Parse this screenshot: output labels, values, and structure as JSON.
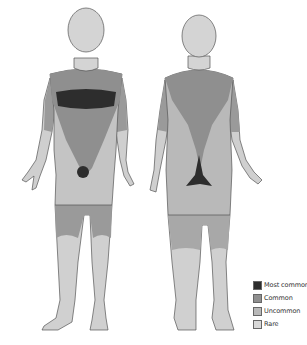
{
  "diagram": {
    "title": "",
    "views": [
      {
        "id": "front",
        "label": ""
      },
      {
        "id": "back",
        "label": ""
      }
    ]
  },
  "colors": {
    "most_common": "#2d2d2d",
    "common": "#8f8f8f",
    "uncommon": "#b9b9b9",
    "rare": "#d8d8d8",
    "outline": "#555555"
  },
  "legend": {
    "items": [
      {
        "label": "Most common",
        "color": "#2d2d2d"
      },
      {
        "label": "Common",
        "color": "#8f8f8f"
      },
      {
        "label": "Uncommon",
        "color": "#b9b9b9"
      },
      {
        "label": "Rare",
        "color": "#d8d8d8"
      }
    ]
  }
}
